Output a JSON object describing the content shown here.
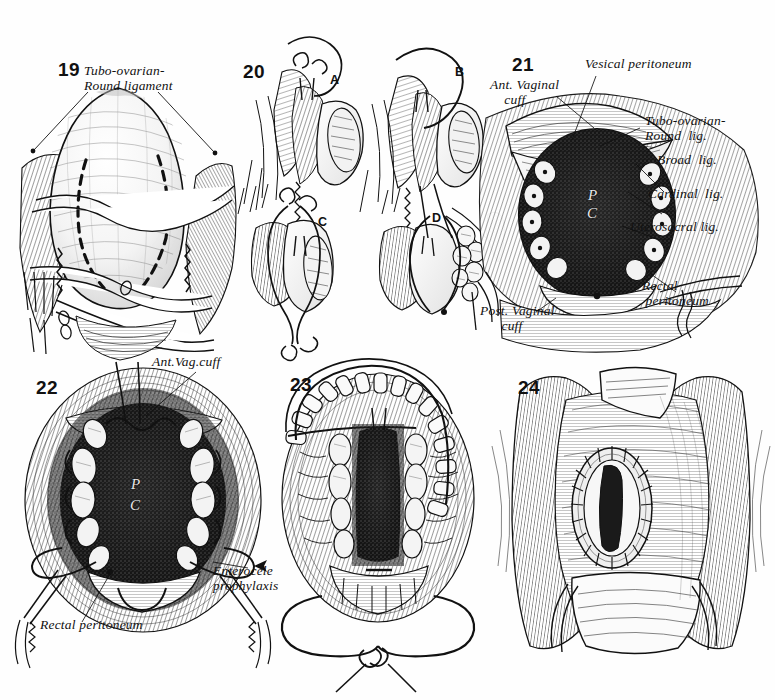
{
  "plate": {
    "title": "Vaginal hysterectomy — closure of the vaginal cuff and enterocele prophylaxis",
    "ink_color": "#111111",
    "paper_color": "#fefefe"
  },
  "figures": [
    {
      "number": "19",
      "labels": [
        {
          "id": "tubo-ovarian-round-ligament",
          "text": "Tubo-ovarian-\nRound ligament"
        }
      ]
    },
    {
      "number": "20",
      "labels": [],
      "sub_panels": [
        {
          "id": "panel-a",
          "text": "A"
        },
        {
          "id": "panel-b",
          "text": "B"
        },
        {
          "id": "panel-c",
          "text": "C"
        },
        {
          "id": "panel-d",
          "text": "D"
        }
      ]
    },
    {
      "number": "21",
      "labels": [
        {
          "id": "vesical-peritoneum",
          "text": "Vesical peritoneum"
        },
        {
          "id": "ant-vaginal-cuff",
          "text": "Ant. Vaginal\n    cuff"
        },
        {
          "id": "tubo-ovarian-round-lig",
          "text": "Tubo-ovarian-\nRound  lig."
        },
        {
          "id": "broad-lig",
          "text": "Broad  lig."
        },
        {
          "id": "cardinal-lig",
          "text": "Cardinal  lig."
        },
        {
          "id": "uterosacral-lig",
          "text": "Uterosacral lig."
        },
        {
          "id": "rectal-peritoneum",
          "text": "Rectal\n peritoneum"
        },
        {
          "id": "post-vaginal-cuff",
          "text": "Post. Vaginal\n      cuff"
        }
      ],
      "cavity_marks": [
        {
          "id": "cavity-p",
          "text": "P"
        },
        {
          "id": "cavity-c",
          "text": "C"
        }
      ]
    },
    {
      "number": "22",
      "labels": [
        {
          "id": "ant-vag-cuff",
          "text": "Ant.Vag.cuff"
        },
        {
          "id": "enterocele-prophylaxis",
          "text": "Enterocele\nprophylaxis"
        },
        {
          "id": "rectal-peritoneum",
          "text": "Rectal peritoneum"
        }
      ],
      "cavity_marks": [
        {
          "id": "cavity-p",
          "text": "P"
        },
        {
          "id": "cavity-c",
          "text": "C"
        }
      ]
    },
    {
      "number": "23",
      "labels": []
    },
    {
      "number": "24",
      "labels": []
    }
  ]
}
